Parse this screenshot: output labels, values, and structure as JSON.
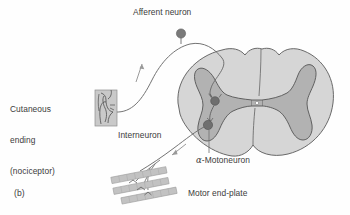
{
  "figure": {
    "panel_label": "(b)",
    "type": "anatomical-diagram",
    "background_color": "#fefefe"
  },
  "labels": {
    "afferent_neuron": "Afferent neuron",
    "cutaneous_ending_line1": "Cutaneous",
    "cutaneous_ending_line2": "ending",
    "cutaneous_ending_line3": "(nociceptor)",
    "interneuron": "Interneuron",
    "motoneuron": "-Motoneuron",
    "motoneuron_prefix": "α",
    "motor_end_plate": "Motor end-plate"
  },
  "colors": {
    "text": "#3c3c3c",
    "outline": "#555555",
    "white_matter": "#d6d6d6",
    "gray_matter": "#b2b2b2",
    "cell_body": "#7a7a7a",
    "skin_patch": "#c9c9c9",
    "muscle_fiber": "#c2c2c2",
    "axon_line": "#6b6b6b",
    "arrow": "#8a8a8a"
  },
  "structures": {
    "spinal_cord": "cross-section with butterfly-shaped gray matter, dorsal median sulcus, ventral median fissure and central canal",
    "dorsal_root_ganglion_cell": "afferent neuron soma, filled circle on stalk",
    "interneuron_soma": "filled circle in dorsal horn",
    "motoneuron_soma": "filled circle in ventral horn",
    "cutaneous_receptor": "rectangular skin patch with branching free nerve endings",
    "motor_end_plates": "three slanted skeletal muscle fibers with terminating axon branches",
    "arrow_afferent": "upward arrow indicating afferent (sensory) conduction toward cord",
    "arrow_efferent": "downward arrow indicating efferent (motor) conduction toward muscle"
  }
}
